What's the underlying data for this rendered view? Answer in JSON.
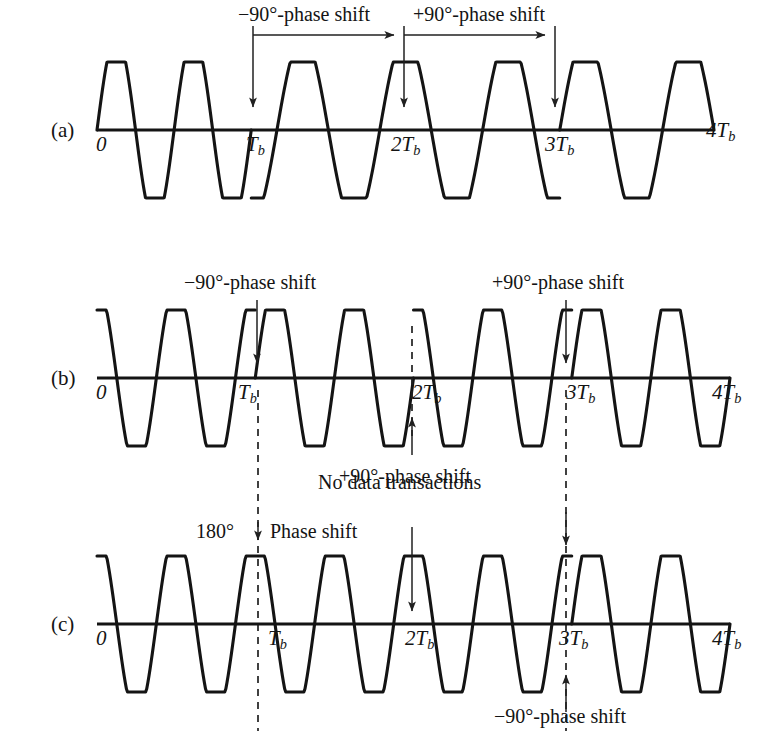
{
  "figure": {
    "panels": [
      {
        "id": "a",
        "tag": "(a)",
        "axis_ticks": [
          "0",
          "T",
          "2T",
          "3T",
          "4T"
        ],
        "tick_subscript": "b",
        "annotations": [
          {
            "name": "minus-90-span",
            "text": "−90°-phase shift"
          },
          {
            "name": "plus-90-span",
            "text": "+90°-phase shift"
          }
        ]
      },
      {
        "id": "b",
        "tag": "(b)",
        "axis_ticks": [
          "0",
          "T",
          "2T",
          "3T",
          "4T"
        ],
        "tick_subscript": "b",
        "annotations": [
          {
            "name": "minus-90-at-tb",
            "text": "−90°-phase shift"
          },
          {
            "name": "plus-90-at-3tb",
            "text": "+90°-phase shift"
          },
          {
            "name": "plus-90-at-2tb",
            "text": "+90°-phase shift"
          }
        ]
      },
      {
        "id": "c",
        "tag": "(c)",
        "axis_ticks": [
          "0",
          "T",
          "2T",
          "3T",
          "4T"
        ],
        "tick_subscript": "b",
        "annotations": [
          {
            "name": "no-data-transactions",
            "text": "No data transactions"
          },
          {
            "name": "phase-shift-180-value",
            "text": "180°"
          },
          {
            "name": "phase-shift-180-text",
            "text": "Phase shift"
          },
          {
            "name": "minus-90-at-3tb",
            "text": "−90°-phase shift"
          }
        ]
      }
    ],
    "colors": {
      "ink": "#141414",
      "background": "#ffffff",
      "guide": "#202020"
    }
  },
  "chart_data": {
    "type": "line",
    "xlabel": "",
    "ylabel": "",
    "x_tick_labels": [
      "0",
      "Tb",
      "2Tb",
      "3Tb",
      "4Tb"
    ],
    "x_tick_values": [
      0,
      1,
      2,
      3,
      4
    ],
    "xlim": [
      0,
      4
    ],
    "ylim": [
      -1,
      1
    ],
    "grid": false,
    "legend": "none",
    "series": [
      {
        "name": "(a) reference / carrier with phase transitions",
        "segments": [
          {
            "interval": [
              0,
              1
            ],
            "cycles": 2,
            "phase_deg": 0,
            "shape": "sine"
          },
          {
            "interval": [
              1,
              2
            ],
            "cycles": 1.5,
            "phase_deg": -90,
            "shape": "sine"
          },
          {
            "interval": [
              2,
              3
            ],
            "cycles": 1.5,
            "phase_deg": 90,
            "shape": "sine"
          },
          {
            "interval": [
              3,
              4
            ],
            "cycles": 1.5,
            "phase_deg": 0,
            "shape": "sine"
          }
        ]
      },
      {
        "name": "(b) modulated waveform",
        "segments": [
          {
            "interval": [
              0,
              1
            ],
            "cycles": 2,
            "phase_deg": 90,
            "shape": "cosine"
          },
          {
            "interval": [
              1,
              2
            ],
            "cycles": 2,
            "phase_deg": 0,
            "shape": "minus-cosine"
          },
          {
            "interval": [
              2,
              3
            ],
            "cycles": 2,
            "phase_deg": 90,
            "shape": "cosine"
          },
          {
            "interval": [
              3,
              4
            ],
            "cycles": 2,
            "phase_deg": 0,
            "shape": "sine"
          }
        ]
      },
      {
        "name": "(c) modulated waveform with 180° shift",
        "segments": [
          {
            "interval": [
              0,
              1
            ],
            "cycles": 2,
            "phase_deg": 90,
            "shape": "cosine"
          },
          {
            "interval": [
              1,
              2
            ],
            "cycles": 2,
            "phase_deg": 90,
            "shape": "cosine"
          },
          {
            "interval": [
              2,
              3
            ],
            "cycles": 2,
            "phase_deg": 90,
            "shape": "cosine"
          },
          {
            "interval": [
              3,
              4
            ],
            "cycles": 2,
            "phase_deg": 0,
            "shape": "sine"
          }
        ]
      }
    ],
    "annotations": [
      {
        "panel": "a",
        "text": "−90°-phase shift",
        "x_from": 1,
        "x_to": 2,
        "type": "span-arrow"
      },
      {
        "panel": "a",
        "text": "+90°-phase shift",
        "x_from": 2,
        "x_to": 3,
        "type": "span-arrow"
      },
      {
        "panel": "b",
        "text": "−90°-phase shift",
        "x": 1,
        "type": "down-arrow"
      },
      {
        "panel": "b",
        "text": "+90°-phase shift",
        "x": 3,
        "type": "down-arrow"
      },
      {
        "panel": "b",
        "text": "+90°-phase shift",
        "x": 2,
        "type": "up-arrow"
      },
      {
        "panel": "c",
        "text": "No data transactions",
        "x": 2,
        "type": "down-arrow"
      },
      {
        "panel": "c",
        "text": "180° Phase shift",
        "x": 1,
        "type": "down-arrow"
      },
      {
        "panel": "c",
        "text": "−90°-phase shift",
        "x": 3,
        "type": "up-arrow"
      }
    ]
  }
}
